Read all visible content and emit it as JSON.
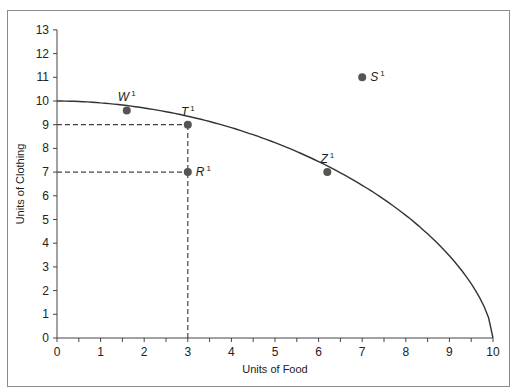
{
  "chart_data": {
    "type": "line",
    "title": "",
    "xlabel": "Units of Food",
    "ylabel": "Units of Clothing",
    "xlim": [
      0,
      10
    ],
    "ylim": [
      0,
      13
    ],
    "x_ticks": [
      0,
      1,
      2,
      3,
      4,
      5,
      6,
      7,
      8,
      9,
      10
    ],
    "y_ticks": [
      0,
      1,
      2,
      3,
      4,
      5,
      6,
      7,
      8,
      9,
      10,
      11,
      12,
      13
    ],
    "grid": false,
    "series": [
      {
        "name": "Production possibilities frontier",
        "type": "curve",
        "x": [
          0,
          1,
          1.6,
          2,
          3,
          4,
          5,
          6,
          6.2,
          7,
          8,
          9,
          9.5,
          10
        ],
        "y": [
          10,
          9.85,
          9.6,
          9.5,
          9.0,
          8.4,
          7.7,
          7.15,
          7.0,
          6.3,
          5.1,
          3.3,
          2.0,
          0
        ]
      }
    ],
    "points": [
      {
        "label": "W",
        "superscript": "1",
        "x": 1.6,
        "y": 9.6
      },
      {
        "label": "T",
        "superscript": "1",
        "x": 3,
        "y": 9
      },
      {
        "label": "R",
        "superscript": "1",
        "x": 3,
        "y": 7
      },
      {
        "label": "Z",
        "superscript": "1",
        "x": 6.2,
        "y": 7
      },
      {
        "label": "S",
        "superscript": "1",
        "x": 7,
        "y": 11
      }
    ],
    "reference_lines": [
      {
        "style": "dashed",
        "from": [
          0,
          9
        ],
        "to": [
          3,
          9
        ]
      },
      {
        "style": "dashed",
        "from": [
          0,
          7
        ],
        "to": [
          3,
          7
        ]
      },
      {
        "style": "dashed",
        "from": [
          3,
          0
        ],
        "to": [
          3,
          9
        ]
      }
    ],
    "colors": {
      "curve": "#333333",
      "point": "#555555",
      "dashed": "#444444",
      "frame": "#8c8c8c"
    }
  }
}
